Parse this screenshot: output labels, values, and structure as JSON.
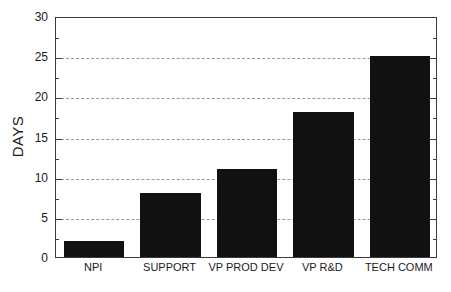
{
  "chart_data": {
    "type": "bar",
    "title": "",
    "xlabel": "",
    "ylabel": "DAYS",
    "categories": [
      "NPI",
      "SUPPORT",
      "VP PROD DEV",
      "VP R&D",
      "TECH COMM"
    ],
    "values": [
      2,
      8,
      11,
      18,
      25
    ],
    "ylim": [
      0,
      30
    ],
    "ytick_step": 5,
    "yticks": [
      0,
      5,
      10,
      15,
      20,
      25,
      30
    ],
    "ytick_labels": [
      "0",
      "5",
      "10",
      "15",
      "20",
      "25",
      "30"
    ],
    "minor_tick_step": 2.5,
    "grid": "horizontal-dashed",
    "legend": "none",
    "bar_color": "#111111",
    "grid_color": "#9a9a9a",
    "axis_color": "#3a3a3a",
    "background_color": "#ffffff"
  }
}
